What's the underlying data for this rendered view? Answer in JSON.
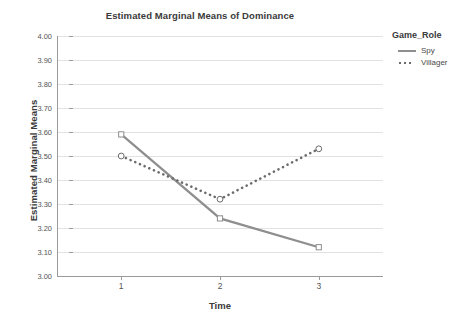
{
  "chart_data": {
    "type": "line",
    "title": "Estimated Marginal Means of Dominance",
    "xlabel": "Time",
    "ylabel": "Estimated Marginal Means",
    "categories": [
      "1",
      "2",
      "3"
    ],
    "x": [
      1,
      2,
      3
    ],
    "xlim": [
      0.35,
      3.65
    ],
    "ylim": [
      3.0,
      4.0
    ],
    "ytick_labels": [
      "3.00",
      "3.10",
      "3.20",
      "3.30",
      "3.40",
      "3.50",
      "3.60",
      "3.70",
      "3.80",
      "3.90",
      "4.00"
    ],
    "ytick_values": [
      3.0,
      3.1,
      3.2,
      3.3,
      3.4,
      3.5,
      3.6,
      3.7,
      3.8,
      3.9,
      4.0
    ],
    "grid": true,
    "legend_position": "right",
    "legend_title": "Game_Role",
    "series": [
      {
        "name": "Spy",
        "values": [
          3.59,
          3.24,
          3.12
        ],
        "line_style": "solid",
        "marker": "square-open",
        "color": "#8e8e8e"
      },
      {
        "name": "Villager",
        "values": [
          3.5,
          3.32,
          3.53
        ],
        "line_style": "dotted",
        "marker": "circle-open",
        "color": "#6b6b6b"
      }
    ]
  },
  "legend": {
    "title": "Game_Role",
    "items": [
      {
        "label": "Spy",
        "style": "solid"
      },
      {
        "label": "Villager",
        "style": "dotted"
      }
    ]
  },
  "axes": {
    "y_ticks": [
      "4.00",
      "3.90",
      "3.80",
      "3.70",
      "3.60",
      "3.50",
      "3.40",
      "3.30",
      "3.20",
      "3.10",
      "3.00"
    ],
    "x_ticks": [
      "1",
      "2",
      "3"
    ]
  },
  "colors": {
    "spy": "#8e8e8e",
    "villager": "#6b6b6b",
    "grid": "#e2e2e2",
    "axis": "#9a9a9a",
    "text": "#3a3a3a"
  }
}
